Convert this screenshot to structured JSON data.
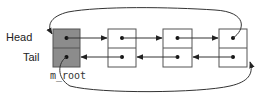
{
  "diagram": {
    "labels": {
      "head": "Head",
      "tail": "Tail",
      "root": "m_root"
    },
    "colors": {
      "root_fill": "#8c8c8c",
      "node_fill": "#ffffff",
      "stroke": "#555555",
      "arrow": "#222222"
    },
    "nodes": [
      {
        "id": "root",
        "x": 53,
        "fill": "root"
      },
      {
        "id": "node1",
        "x": 108,
        "fill": "node"
      },
      {
        "id": "node2",
        "x": 163,
        "fill": "node"
      },
      {
        "id": "node3",
        "x": 219,
        "fill": "node"
      }
    ],
    "edges": [
      {
        "from": "root.next",
        "to": "node1",
        "type": "next"
      },
      {
        "from": "node1.next",
        "to": "node2",
        "type": "next"
      },
      {
        "from": "node2.next",
        "to": "node3",
        "type": "next"
      },
      {
        "from": "node1.prev",
        "to": "root",
        "type": "prev"
      },
      {
        "from": "node2.prev",
        "to": "node1",
        "type": "prev"
      },
      {
        "from": "node3.prev",
        "to": "node2",
        "type": "prev"
      },
      {
        "from": "node3.next",
        "to": "root",
        "type": "wrap-next"
      },
      {
        "from": "root.prev",
        "to": "node3",
        "type": "wrap-prev"
      }
    ]
  }
}
